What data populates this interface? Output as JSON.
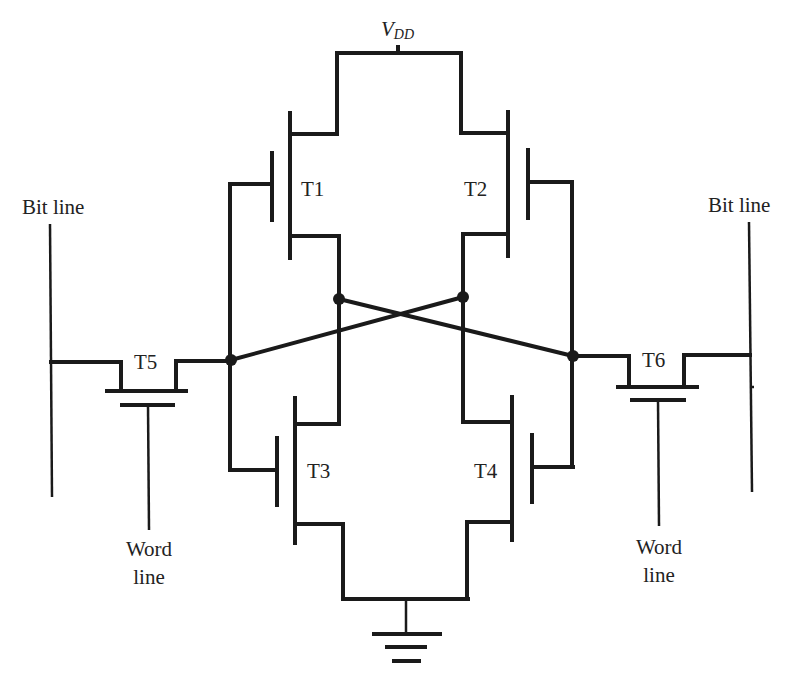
{
  "supply": {
    "main": "V",
    "sub": "DD"
  },
  "transistors": [
    {
      "id": "T1",
      "label": "T1"
    },
    {
      "id": "T2",
      "label": "T2"
    },
    {
      "id": "T3",
      "label": "T3"
    },
    {
      "id": "T4",
      "label": "T4"
    },
    {
      "id": "T5",
      "label": "T5"
    },
    {
      "id": "T6",
      "label": "T6"
    }
  ],
  "lines": {
    "bit_left": "Bit line",
    "bit_right": "Bit line",
    "word_left_1": "Word",
    "word_left_2": "line",
    "word_right_1": "Word",
    "word_right_2": "line"
  },
  "colors": {
    "wire": "#1a1a1a",
    "background": "#ffffff"
  }
}
